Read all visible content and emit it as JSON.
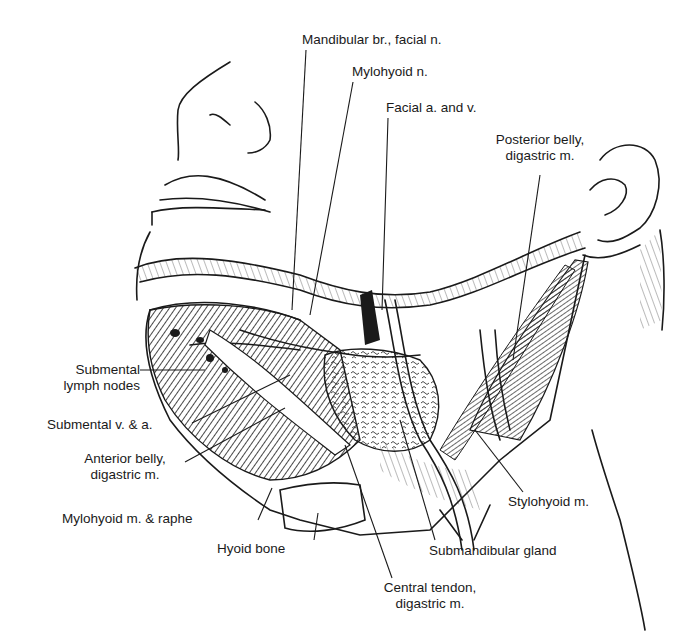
{
  "figure": {
    "labels": {
      "mandibular_br": "Mandibular br., facial n.",
      "mylohyoid_n": "Mylohyoid n.",
      "facial_av": "Facial a. and v.",
      "posterior_belly_1": "Posterior belly,",
      "posterior_belly_2": "digastric m.",
      "submental_lymph_1": "Submental",
      "submental_lymph_2": "lymph nodes",
      "submental_va": "Submental v. & a.",
      "anterior_belly_1": "Anterior belly,",
      "anterior_belly_2": "digastric m.",
      "mylohyoid_raphe": "Mylohyoid m. & raphe",
      "hyoid_bone": "Hyoid bone",
      "central_tendon_1": "Central tendon,",
      "central_tendon_2": "digastric m.",
      "submandibular_gland": "Submandibular gland",
      "stylohyoid": "Stylohyoid m."
    },
    "colors": {
      "ink": "#1a1a1a",
      "paper": "#ffffff"
    }
  }
}
